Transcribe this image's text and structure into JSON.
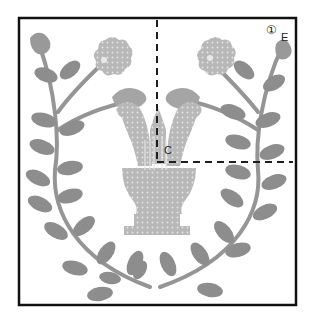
{
  "diagram": {
    "type": "applique-pattern",
    "labels": {
      "piece_number": "①",
      "corner_label": "E",
      "center_label": "C"
    },
    "colors": {
      "border": "#111111",
      "leaf": "#8a8a8a",
      "stem": "#949494",
      "flower": "#b4b4b4",
      "lyre": "#bdbdbd",
      "dash": "#222222",
      "background": "#ffffff"
    },
    "elements": [
      "square-frame",
      "laurel-wreath",
      "two-roses",
      "two-rosebuds",
      "two-top-buds",
      "lyre",
      "center-guide-lines"
    ]
  }
}
